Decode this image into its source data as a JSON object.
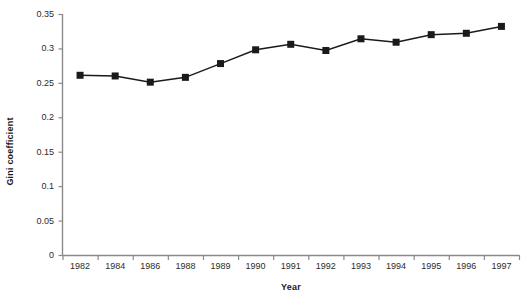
{
  "chart_data": {
    "type": "line",
    "title": "",
    "subtitle": "",
    "xlabel": "Year",
    "ylabel": "Gini coefficient",
    "categories": [
      "1982",
      "1984",
      "1986",
      "1988",
      "1989",
      "1990",
      "1991",
      "1992",
      "1993",
      "1994",
      "1995",
      "1996",
      "1997"
    ],
    "values": [
      0.261,
      0.26,
      0.251,
      0.258,
      0.278,
      0.298,
      0.306,
      0.297,
      0.314,
      0.309,
      0.32,
      0.322,
      0.332
    ],
    "series": [
      {
        "name": "Gini coefficient",
        "values": [
          0.261,
          0.26,
          0.251,
          0.258,
          0.278,
          0.298,
          0.306,
          0.297,
          0.314,
          0.309,
          0.32,
          0.322,
          0.332
        ]
      }
    ],
    "ylim": [
      0,
      0.35
    ],
    "yticks": [
      0,
      0.05,
      0.1,
      0.15,
      0.2,
      0.25,
      0.3,
      0.35
    ],
    "ytick_labels": [
      "0",
      "0.05",
      "0.1",
      "0.15",
      "0.2",
      "0.25",
      "0.3",
      "0.35"
    ],
    "grid": false,
    "legend": null,
    "legend_position": "none",
    "marker": "square",
    "line_color": "#1a1a1a",
    "marker_color": "#1a1a1a",
    "axis_color": "#8a8a8a"
  },
  "axes": {
    "y_title": "Gini coefficient",
    "x_title": "Year"
  }
}
